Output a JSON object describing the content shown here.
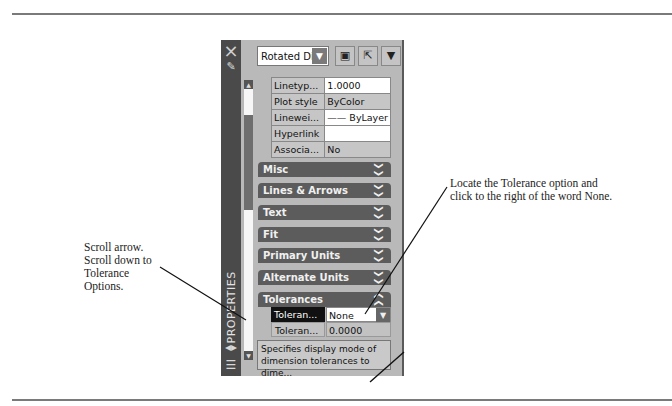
{
  "callouts": {
    "left": [
      "Scroll arrow.",
      "Scroll down to",
      "Tolerance",
      "Options."
    ],
    "right": [
      "Locate the Tolerance option and",
      "click to the right of the word None."
    ]
  },
  "panel": {
    "title_vertical": "PROPERTIES",
    "icons": {
      "close": "×",
      "pin": "✎",
      "toggle": "◂▸",
      "properties": "☰"
    },
    "object_select": {
      "value": "Rotated Di",
      "arrow": "▼"
    },
    "toolbar_buttons": [
      {
        "name": "toggle-pickadd",
        "glyph": "▣"
      },
      {
        "name": "select-objects",
        "glyph": "⇱"
      },
      {
        "name": "quick-select",
        "glyph": "▼"
      }
    ],
    "properties": [
      {
        "key": "Linetyp...",
        "value": "1.0000",
        "white": true
      },
      {
        "key": "Plot style",
        "value": "ByColor",
        "white": false
      },
      {
        "key": "Linewei...",
        "value": "—— ByLayer",
        "white": true
      },
      {
        "key": "Hyperlink",
        "value": "",
        "white": true
      },
      {
        "key": "Associa...",
        "value": "No",
        "white": false
      }
    ],
    "categories": [
      {
        "label": "Misc",
        "chevron": "❯❯"
      },
      {
        "label": "Lines & Arrows",
        "chevron": "❯❯"
      },
      {
        "label": "Text",
        "chevron": "❯❯"
      },
      {
        "label": "Fit",
        "chevron": "❯❯"
      },
      {
        "label": "Primary Units",
        "chevron": "❯❯"
      },
      {
        "label": "Alternate Units",
        "chevron": "❯❯"
      },
      {
        "label": "Tolerances",
        "chevron": "❯❯"
      }
    ],
    "tolerance_rows": [
      {
        "key": "Toleran...",
        "value": "None",
        "dropdown": "▼"
      },
      {
        "key": "Toleran...",
        "value": "0.0000"
      }
    ],
    "description": "Specifies display mode of dimension tolerances to dime...",
    "scroll": {
      "up": "▲",
      "down": "▼"
    }
  }
}
